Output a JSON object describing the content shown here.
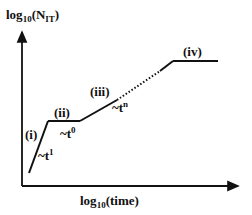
{
  "diagram": {
    "y_axis_label": {
      "main": "log",
      "sub": "10",
      "open": "(N",
      "sub2": "IT",
      "close": ")"
    },
    "x_axis_label": {
      "main": "log",
      "sub": "10",
      "rest": "(time)"
    },
    "regimes": [
      {
        "id": "i",
        "label": "(i)",
        "scaling": {
          "base": "~t",
          "exp": "1"
        }
      },
      {
        "id": "ii",
        "label": "(ii)",
        "scaling": {
          "base": "~t",
          "exp": "0"
        }
      },
      {
        "id": "iii",
        "label": "(iii)",
        "scaling": {
          "base": "~t",
          "exp": "n"
        }
      },
      {
        "id": "iv",
        "label": "(iv)"
      }
    ],
    "line_color": "#111111"
  }
}
